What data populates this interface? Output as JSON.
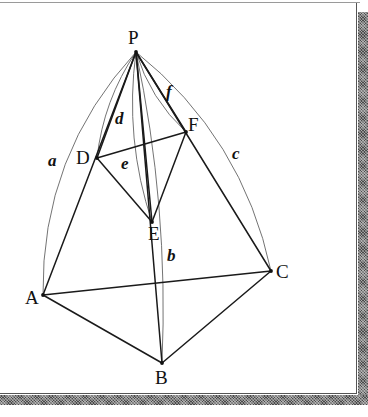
{
  "figure": {
    "background_color": "#ffffff",
    "edge_color": "#1a1a1a",
    "arc_color": "#5a5a5a",
    "frame": {
      "shadow_color": "#4a4a4a",
      "rule_color": "#9a9a9a"
    }
  },
  "vertices": [
    {
      "id": "P",
      "label": "P",
      "x": 136,
      "y": 52,
      "label_x": 128,
      "label_y": 28
    },
    {
      "id": "D",
      "label": "D",
      "x": 97,
      "y": 158,
      "label_x": 76,
      "label_y": 148
    },
    {
      "id": "F",
      "label": "F",
      "x": 186,
      "y": 132,
      "label_x": 188,
      "label_y": 115
    },
    {
      "id": "E",
      "label": "E",
      "x": 152,
      "y": 222,
      "label_x": 148,
      "label_y": 224
    },
    {
      "id": "A",
      "label": "A",
      "x": 43,
      "y": 295,
      "label_x": 25,
      "label_y": 288
    },
    {
      "id": "C",
      "label": "C",
      "x": 271,
      "y": 271,
      "label_x": 276,
      "label_y": 262
    },
    {
      "id": "B",
      "label": "B",
      "x": 162,
      "y": 363,
      "label_x": 155,
      "label_y": 368
    }
  ],
  "edges": [
    {
      "name": "P-A",
      "from": "P",
      "to": "A"
    },
    {
      "name": "P-B",
      "from": "P",
      "to": "B"
    },
    {
      "name": "P-C",
      "from": "P",
      "to": "C"
    },
    {
      "name": "P-D",
      "from": "P",
      "to": "D"
    },
    {
      "name": "P-E",
      "from": "P",
      "to": "E"
    },
    {
      "name": "P-F",
      "from": "P",
      "to": "F"
    },
    {
      "name": "A-B",
      "from": "A",
      "to": "B"
    },
    {
      "name": "B-C",
      "from": "B",
      "to": "C"
    },
    {
      "name": "A-C",
      "from": "A",
      "to": "C"
    },
    {
      "name": "D-E",
      "from": "D",
      "to": "E"
    },
    {
      "name": "E-F",
      "from": "E",
      "to": "F"
    },
    {
      "name": "D-F",
      "from": "D",
      "to": "F"
    }
  ],
  "arcs": [
    {
      "id": "a",
      "label": "a",
      "from": "P",
      "to": "A",
      "bulge": "left",
      "label_x": 48,
      "label_y": 152
    },
    {
      "id": "b",
      "label": "b",
      "from": "P",
      "to": "B",
      "bulge": "right",
      "label_x": 167,
      "label_y": 247
    },
    {
      "id": "c",
      "label": "c",
      "from": "P",
      "to": "C",
      "bulge": "right",
      "label_x": 232,
      "label_y": 145
    },
    {
      "id": "d",
      "label": "d",
      "from": "P",
      "to": "D",
      "bulge": "left",
      "label_x": 115,
      "label_y": 110
    },
    {
      "id": "e",
      "label": "e",
      "from": "P",
      "to": "E",
      "bulge": "left",
      "label_x": 121,
      "label_y": 155
    },
    {
      "id": "f",
      "label": "f",
      "from": "P",
      "to": "F",
      "bulge": "left",
      "label_x": 166,
      "label_y": 83
    }
  ]
}
